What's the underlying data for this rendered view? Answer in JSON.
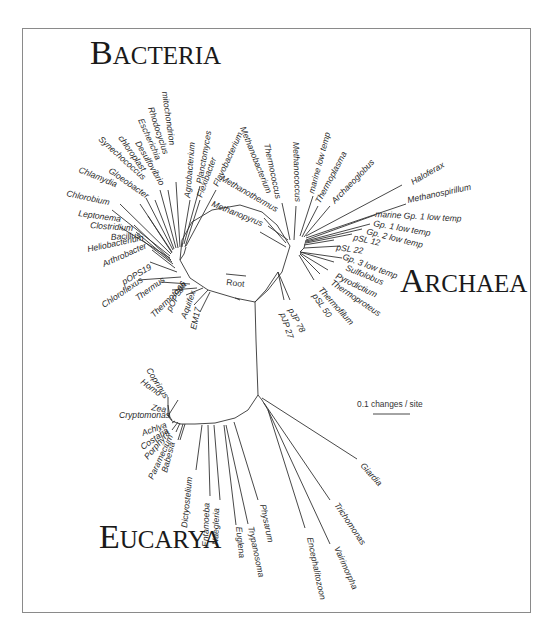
{
  "figure": {
    "domains": {
      "bacteria": {
        "first": "B",
        "rest": "ACTERIA",
        "x": 90,
        "y": 64
      },
      "archaea": {
        "first": "A",
        "rest": "RCHAEA",
        "x": 400,
        "y": 292
      },
      "eucarya": {
        "first": "E",
        "rest": "UCARYA",
        "x": 99,
        "y": 548
      }
    },
    "root_label": "Root",
    "scale_bar": {
      "label": "0.1 changes / site",
      "x": 357,
      "y": 407,
      "bar_x1": 373,
      "bar_x2": 410,
      "bar_y": 414
    },
    "hubs": {
      "bacteria": [
        180,
        260
      ],
      "bacteria_lower": [
        210,
        290
      ],
      "archaea": [
        290,
        246
      ],
      "archaea_lower": [
        300,
        252
      ],
      "eucarya": [
        258,
        395
      ],
      "root_junction": [
        255,
        302
      ]
    },
    "backbone": [
      [
        [
          180,
          260
        ],
        [
          182,
          240
        ],
        [
          192,
          222
        ],
        [
          212,
          210
        ],
        [
          240,
          205
        ],
        [
          262,
          212
        ],
        [
          277,
          225
        ],
        [
          290,
          246
        ]
      ],
      [
        [
          180,
          260
        ],
        [
          190,
          278
        ],
        [
          208,
          290
        ],
        [
          235,
          298
        ],
        [
          255,
          302
        ]
      ],
      [
        [
          255,
          302
        ],
        [
          268,
          290
        ],
        [
          282,
          272
        ],
        [
          290,
          246
        ]
      ],
      [
        [
          255,
          302
        ],
        [
          256,
          340
        ],
        [
          258,
          395
        ]
      ],
      [
        [
          258,
          395
        ],
        [
          248,
          410
        ],
        [
          235,
          418
        ],
        [
          215,
          423
        ],
        [
          195,
          424
        ],
        [
          180,
          424
        ],
        [
          172,
          421
        ],
        [
          168,
          416
        ]
      ]
    ],
    "taxa": [
      {
        "name": "Planctomyces",
        "group": "bacteria",
        "tip": [
          200,
          186
        ],
        "anchor": [
          184,
          244
        ],
        "tx": 202,
        "ty": 184,
        "rot": -80
      },
      {
        "name": "Flavobacterium",
        "group": "bacteria",
        "tip": [
          216,
          190
        ],
        "anchor": [
          186,
          246
        ],
        "tx": 218,
        "ty": 187,
        "rot": -65
      },
      {
        "name": "Flexibacter",
        "group": "bacteria",
        "tip": [
          200,
          200
        ],
        "anchor": [
          185,
          247
        ],
        "tx": 202,
        "ty": 198,
        "rot": -70
      },
      {
        "name": "Agrobacterium",
        "group": "bacteria",
        "tip": [
          190,
          200
        ],
        "anchor": [
          182,
          247
        ],
        "tx": 190,
        "ty": 198,
        "rot": -85
      },
      {
        "name": "mitochondrion",
        "group": "bacteria",
        "tip": [
          176,
          182
        ],
        "anchor": [
          180,
          247
        ],
        "tx": 162,
        "ty": 92,
        "rot": 82
      },
      {
        "name": "Rhodocyclus",
        "group": "bacteria",
        "tip": [
          168,
          190
        ],
        "anchor": [
          178,
          248
        ],
        "tx": 148,
        "ty": 108,
        "rot": 72
      },
      {
        "name": "Escherichia",
        "group": "bacteria",
        "tip": [
          160,
          190
        ],
        "anchor": [
          176,
          248
        ],
        "tx": 138,
        "ty": 120,
        "rot": 66
      },
      {
        "name": "Desulfovibrio",
        "group": "bacteria",
        "tip": [
          155,
          200
        ],
        "anchor": [
          174,
          249
        ],
        "tx": 135,
        "ty": 143,
        "rot": 60
      },
      {
        "name": "chloroplast",
        "group": "bacteria",
        "tip": [
          146,
          198
        ],
        "anchor": [
          173,
          250
        ],
        "tx": 118,
        "ty": 138,
        "rot": 55
      },
      {
        "name": "Synechococcus",
        "group": "bacteria",
        "tip": [
          140,
          204
        ],
        "anchor": [
          172,
          252
        ],
        "tx": 98,
        "ty": 140,
        "rot": 42
      },
      {
        "name": "Gloeobacter",
        "group": "bacteria",
        "tip": [
          148,
          216
        ],
        "anchor": [
          172,
          253
        ],
        "tx": 108,
        "ty": 172,
        "rot": 35
      },
      {
        "name": "Chlamydia",
        "group": "bacteria",
        "tip": [
          120,
          204
        ],
        "anchor": [
          171,
          254
        ],
        "tx": 78,
        "ty": 172,
        "rot": 22
      },
      {
        "name": "Chlorobium",
        "group": "bacteria",
        "tip": [
          112,
          210
        ],
        "anchor": [
          170,
          256
        ],
        "tx": 66,
        "ty": 196,
        "rot": 12
      },
      {
        "name": "Leptonema",
        "group": "bacteria",
        "tip": [
          120,
          227
        ],
        "anchor": [
          170,
          258
        ],
        "tx": 78,
        "ty": 216,
        "rot": 8
      },
      {
        "name": "Clostridium",
        "group": "bacteria",
        "tip": [
          134,
          225
        ],
        "anchor": [
          171,
          260
        ],
        "tx": 90,
        "ty": 228,
        "rot": 4
      },
      {
        "name": "Bacillus",
        "group": "bacteria",
        "tip": [
          136,
          232
        ],
        "anchor": [
          172,
          262
        ],
        "tx": 111,
        "ty": 240,
        "rot": -4
      },
      {
        "name": "Heliobacterium",
        "group": "bacteria",
        "tip": [
          142,
          240
        ],
        "anchor": [
          173,
          264
        ],
        "tx": 88,
        "ty": 252,
        "rot": -12
      },
      {
        "name": "Arthrobacter",
        "group": "bacteria",
        "tip": [
          152,
          250
        ],
        "anchor": [
          175,
          268
        ],
        "tx": 104,
        "ty": 267,
        "rot": -24
      },
      {
        "name": "pOPS19",
        "group": "bacteria",
        "tip": [
          150,
          262
        ],
        "anchor": [
          177,
          272
        ],
        "tx": 124,
        "ty": 285,
        "rot": -30
      },
      {
        "name": "Chloroflexus",
        "group": "bacteria",
        "tip": [
          138,
          280
        ],
        "anchor": [
          181,
          277
        ],
        "tx": 104,
        "ty": 308,
        "rot": -34
      },
      {
        "name": "Thermus",
        "group": "bacteria",
        "tip": [
          160,
          282
        ],
        "anchor": [
          190,
          284
        ],
        "tx": 138,
        "ty": 301,
        "rot": -36
      },
      {
        "name": "Thermotoga",
        "group": "bacteria",
        "tip": [
          172,
          290
        ],
        "anchor": [
          197,
          288
        ],
        "tx": 154,
        "ty": 318,
        "rot": -45
      },
      {
        "name": "pOPS66",
        "group": "bacteria",
        "tip": [
          186,
          295
        ],
        "anchor": [
          203,
          288
        ],
        "tx": 171,
        "ty": 312,
        "rot": -62
      },
      {
        "name": "Aquifex",
        "group": "bacteria",
        "tip": [
          194,
          305
        ],
        "anchor": [
          208,
          290
        ],
        "tx": 186,
        "ty": 319,
        "rot": -70
      },
      {
        "name": "EM17",
        "group": "bacteria",
        "tip": [
          200,
          312
        ],
        "anchor": [
          210,
          292
        ],
        "tx": 196,
        "ty": 330,
        "rot": -78
      },
      {
        "name": "Methanobacterium",
        "group": "archaea",
        "tip": [
          268,
          226
        ],
        "anchor": [
          288,
          240
        ],
        "tx": 240,
        "ty": 128,
        "rot": 68
      },
      {
        "name": "Thermococcus",
        "group": "archaea",
        "tip": [
          282,
          203
        ],
        "anchor": [
          290,
          240
        ],
        "tx": 264,
        "ty": 144,
        "rot": 78
      },
      {
        "name": "Methanococcus",
        "group": "archaea",
        "tip": [
          296,
          206
        ],
        "anchor": [
          294,
          240
        ],
        "tx": 293,
        "ty": 142,
        "rot": 88
      },
      {
        "name": "Methanothermus",
        "group": "archaea",
        "tip": [
          264,
          218
        ],
        "anchor": [
          286,
          243
        ],
        "tx": 220,
        "ty": 180,
        "rot": 30
      },
      {
        "name": "Methanopyrus",
        "group": "archaea",
        "tip": [
          260,
          232
        ],
        "anchor": [
          286,
          247
        ],
        "tx": 211,
        "ty": 206,
        "rot": 22
      },
      {
        "name": "marine low temp",
        "group": "archaea",
        "tip": [
          313,
          196
        ],
        "anchor": [
          300,
          236
        ],
        "tx": 314,
        "ty": 194,
        "rot": -75
      },
      {
        "name": "Thermoplasma",
        "group": "archaea",
        "tip": [
          318,
          206
        ],
        "anchor": [
          302,
          237
        ],
        "tx": 320,
        "ty": 204,
        "rot": -62
      },
      {
        "name": "Archaeoglobus",
        "group": "archaea",
        "tip": [
          330,
          206
        ],
        "anchor": [
          304,
          237
        ],
        "tx": 335,
        "ty": 204,
        "rot": -46
      },
      {
        "name": "Haloferax",
        "group": "archaea",
        "tip": [
          402,
          185
        ],
        "anchor": [
          306,
          236
        ],
        "tx": 413,
        "ty": 185,
        "rot": -30
      },
      {
        "name": "Methanospirillum",
        "group": "archaea",
        "tip": [
          406,
          204
        ],
        "anchor": [
          306,
          238
        ],
        "tx": 408,
        "ty": 203,
        "rot": -12
      },
      {
        "name": "marine Gp. 1 low temp",
        "group": "archaea",
        "tip": [
          375,
          215
        ],
        "anchor": [
          306,
          240
        ],
        "tx": 375,
        "ty": 217,
        "rot": 3
      },
      {
        "name": "Gp. 1 low temp",
        "group": "archaea",
        "tip": [
          370,
          224
        ],
        "anchor": [
          306,
          241
        ],
        "tx": 373,
        "ty": 226,
        "rot": 10
      },
      {
        "name": "Gp. 2 low temp",
        "group": "archaea",
        "tip": [
          362,
          229
        ],
        "anchor": [
          306,
          242
        ],
        "tx": 366,
        "ty": 234,
        "rot": 14
      },
      {
        "name": "pSL 12",
        "group": "archaea",
        "tip": [
          352,
          234
        ],
        "anchor": [
          306,
          243
        ],
        "tx": 353,
        "ty": 240,
        "rot": 12
      },
      {
        "name": "pSL 22",
        "group": "archaea",
        "tip": [
          334,
          240
        ],
        "anchor": [
          304,
          245
        ],
        "tx": 336,
        "ty": 250,
        "rot": 8
      },
      {
        "name": "Gp. 3 low temp",
        "group": "archaea",
        "tip": [
          340,
          246
        ],
        "anchor": [
          304,
          248
        ],
        "tx": 342,
        "ty": 259,
        "rot": 20
      },
      {
        "name": "Sulfolobus",
        "group": "archaea",
        "tip": [
          342,
          258
        ],
        "anchor": [
          300,
          252
        ],
        "tx": 345,
        "ty": 270,
        "rot": 22
      },
      {
        "name": "Pyrodictium",
        "group": "archaea",
        "tip": [
          334,
          262
        ],
        "anchor": [
          300,
          252
        ],
        "tx": 335,
        "ty": 278,
        "rot": 26
      },
      {
        "name": "Thermoproteus",
        "group": "archaea",
        "tip": [
          328,
          270
        ],
        "anchor": [
          300,
          253
        ],
        "tx": 330,
        "ty": 284,
        "rot": 34
      },
      {
        "name": "Thermofilum",
        "group": "archaea",
        "tip": [
          320,
          274
        ],
        "anchor": [
          300,
          254
        ],
        "tx": 318,
        "ty": 290,
        "rot": 48
      },
      {
        "name": "pSL 50",
        "group": "archaea",
        "tip": [
          314,
          280
        ],
        "anchor": [
          299,
          255
        ],
        "tx": 312,
        "ty": 296,
        "rot": 55
      },
      {
        "name": "pJP 78",
        "group": "archaea",
        "tip": [
          290,
          300
        ],
        "anchor": [
          278,
          272
        ],
        "tx": 288,
        "ty": 310,
        "rot": 62
      },
      {
        "name": "pJP 27",
        "group": "archaea",
        "tip": [
          284,
          300
        ],
        "anchor": [
          278,
          272
        ],
        "tx": 280,
        "ty": 314,
        "rot": 72
      },
      {
        "name": "Coprinus",
        "group": "eucarya",
        "tip": [
          178,
          400
        ],
        "anchor": [
          168,
          416
        ],
        "tx": 146,
        "ty": 370,
        "rot": 58
      },
      {
        "name": "Homo",
        "group": "eucarya",
        "tip": [
          168,
          397
        ],
        "anchor": [
          168,
          416
        ],
        "tx": 140,
        "ty": 383,
        "rot": 36
      },
      {
        "name": "Zea",
        "group": "eucarya",
        "tip": [
          168,
          405
        ],
        "anchor": [
          170,
          418
        ],
        "tx": 151,
        "ty": 410,
        "rot": 10
      },
      {
        "name": "Cryptomonas",
        "group": "eucarya",
        "tip": [
          168,
          415
        ],
        "anchor": [
          172,
          420
        ],
        "tx": 119,
        "ty": 418,
        "rot": 0
      },
      {
        "name": "Achlya",
        "group": "eucarya",
        "tip": [
          172,
          423
        ],
        "anchor": [
          175,
          421
        ],
        "tx": 143,
        "ty": 436,
        "rot": -20
      },
      {
        "name": "Costaria",
        "group": "eucarya",
        "tip": [
          172,
          430
        ],
        "anchor": [
          178,
          422
        ],
        "tx": 143,
        "ty": 450,
        "rot": -35
      },
      {
        "name": "Porphyra",
        "group": "eucarya",
        "tip": [
          176,
          432
        ],
        "anchor": [
          180,
          423
        ],
        "tx": 148,
        "ty": 460,
        "rot": -50
      },
      {
        "name": "Paramecium",
        "group": "eucarya",
        "tip": [
          178,
          440
        ],
        "anchor": [
          183,
          424
        ],
        "tx": 153,
        "ty": 480,
        "rot": -65
      },
      {
        "name": "Babesia",
        "group": "eucarya",
        "tip": [
          180,
          440
        ],
        "anchor": [
          185,
          424
        ],
        "tx": 167,
        "ty": 473,
        "rot": -75
      },
      {
        "name": "Dictyostelium",
        "group": "eucarya",
        "tip": [
          196,
          470
        ],
        "anchor": [
          202,
          425
        ],
        "tx": 187,
        "ty": 528,
        "rot": -84
      },
      {
        "name": "Entamoeba",
        "group": "eucarya",
        "tip": [
          210,
          496
        ],
        "anchor": [
          208,
          425
        ],
        "tx": 208,
        "ty": 547,
        "rot": -88
      },
      {
        "name": "Naegleria",
        "group": "eucarya",
        "tip": [
          220,
          500
        ],
        "anchor": [
          214,
          425
        ],
        "tx": 218,
        "ty": 545,
        "rot": -88
      },
      {
        "name": "Euglena",
        "group": "eucarya",
        "tip": [
          236,
          525
        ],
        "anchor": [
          224,
          425
        ],
        "tx": 236,
        "ty": 527,
        "rot": 84
      },
      {
        "name": "Trypanosoma",
        "group": "eucarya",
        "tip": [
          248,
          524
        ],
        "anchor": [
          226,
          425
        ],
        "tx": 248,
        "ty": 527,
        "rot": 78
      },
      {
        "name": "Physarum",
        "group": "eucarya",
        "tip": [
          258,
          500
        ],
        "anchor": [
          234,
          422
        ],
        "tx": 260,
        "ty": 505,
        "rot": 78
      },
      {
        "name": "Encephalitozoon",
        "group": "eucarya",
        "tip": [
          305,
          528
        ],
        "anchor": [
          268,
          410
        ],
        "tx": 307,
        "ty": 538,
        "rot": 78
      },
      {
        "name": "Vairimorpha",
        "group": "eucarya",
        "tip": [
          330,
          544
        ],
        "anchor": [
          268,
          410
        ],
        "tx": 334,
        "ty": 548,
        "rot": 66
      },
      {
        "name": "Trichomonas",
        "group": "eucarya",
        "tip": [
          330,
          500
        ],
        "anchor": [
          264,
          403
        ],
        "tx": 334,
        "ty": 505,
        "rot": 56
      },
      {
        "name": "Giardia",
        "group": "eucarya",
        "tip": [
          357,
          459
        ],
        "anchor": [
          262,
          398
        ],
        "tx": 360,
        "ty": 466,
        "rot": 48
      }
    ],
    "subbranches": [
      [
        [
          180,
          260
        ],
        [
          184,
          254
        ],
        [
          186,
          247
        ]
      ],
      [
        [
          300,
          252
        ],
        [
          304,
          248
        ],
        [
          306,
          240
        ]
      ],
      [
        [
          258,
          395
        ],
        [
          262,
          400
        ],
        [
          268,
          410
        ]
      ],
      [
        [
          255,
          302
        ],
        [
          266,
          290
        ],
        [
          278,
          272
        ]
      ],
      [
        [
          235,
          298
        ],
        [
          240,
          300
        ]
      ]
    ]
  }
}
